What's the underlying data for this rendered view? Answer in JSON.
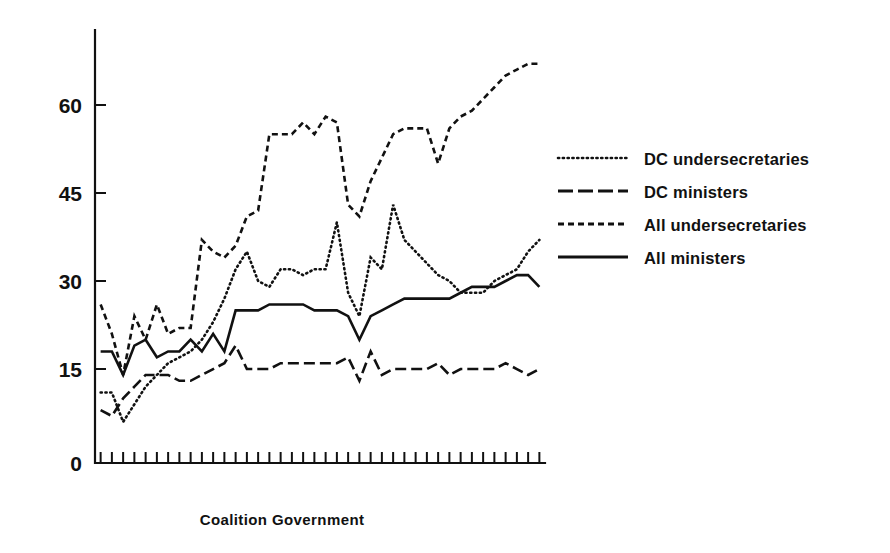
{
  "chart_data": {
    "type": "line",
    "title": "",
    "xlabel": "Coalition Government",
    "ylabel": "",
    "ylim": [
      0,
      70
    ],
    "yticks": [
      0,
      15,
      30,
      45,
      60
    ],
    "ytick_labels": [
      "0",
      "15",
      "30",
      "45",
      "60"
    ],
    "grid": false,
    "legend_position": "right",
    "x_axis_tick_count": 40,
    "x_tick_labels_shown": false,
    "x": [
      1,
      2,
      3,
      4,
      5,
      6,
      7,
      8,
      9,
      10,
      11,
      12,
      13,
      14,
      15,
      16,
      17,
      18,
      19,
      20,
      21,
      22,
      23,
      24,
      25,
      26,
      27,
      28,
      29,
      30,
      31,
      32,
      33,
      34,
      35,
      36,
      37,
      38,
      39,
      40
    ],
    "series": [
      {
        "name": "DC undersecretaries",
        "line_style": "dotted",
        "values": [
          12,
          12,
          7,
          10,
          13,
          15,
          17,
          18,
          19,
          21,
          24,
          28,
          33,
          36,
          31,
          30,
          33,
          33,
          32,
          33,
          33,
          41,
          29,
          25,
          35,
          33,
          44,
          38,
          36,
          34,
          32,
          31,
          29,
          29,
          29,
          31,
          32,
          33,
          36,
          38
        ]
      },
      {
        "name": "DC ministers",
        "line_style": "long-dash",
        "values": [
          9,
          8,
          11,
          13,
          15,
          15,
          15,
          14,
          14,
          15,
          16,
          17,
          20,
          16,
          16,
          16,
          17,
          17,
          17,
          17,
          17,
          17,
          18,
          14,
          19,
          15,
          16,
          16,
          16,
          16,
          17,
          15,
          16,
          16,
          16,
          16,
          17,
          16,
          15,
          16
        ]
      },
      {
        "name": "All undersecretaries",
        "line_style": "dashed",
        "values": [
          27,
          22,
          15,
          25,
          21,
          27,
          22,
          23,
          23,
          38,
          36,
          35,
          37,
          42,
          43,
          56,
          56,
          56,
          58,
          56,
          59,
          58,
          44,
          42,
          48,
          52,
          56,
          57,
          57,
          57,
          51,
          57,
          59,
          60,
          62,
          64,
          66,
          67,
          68,
          68
        ]
      },
      {
        "name": "All ministers",
        "line_style": "solid",
        "values": [
          19,
          19,
          15,
          20,
          21,
          18,
          19,
          19,
          21,
          19,
          22,
          19,
          26,
          26,
          26,
          27,
          27,
          27,
          27,
          26,
          26,
          26,
          25,
          21,
          25,
          26,
          27,
          28,
          28,
          28,
          28,
          28,
          29,
          30,
          30,
          30,
          31,
          32,
          32,
          30
        ]
      }
    ]
  },
  "legend": {
    "items": [
      {
        "label": "DC undersecretaries",
        "style": "dotted"
      },
      {
        "label": "DC ministers",
        "style": "long-dash"
      },
      {
        "label": "All undersecretaries",
        "style": "dashed"
      },
      {
        "label": "All ministers",
        "style": "solid"
      }
    ]
  },
  "axes": {
    "y_labels": [
      "60",
      "45",
      "30",
      "15",
      "0"
    ],
    "x_title": "Coalition Government"
  }
}
